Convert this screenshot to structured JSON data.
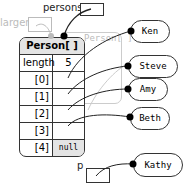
{
  "variables": {
    "persons": "persons",
    "larger": "larger",
    "p": "p"
  },
  "array": {
    "title": "Person[ ]",
    "ghost_title": "Person[ ]",
    "length_label": "length",
    "length_value": "5",
    "indices": [
      "[0]",
      "[1]",
      "[2]",
      "[3]",
      "[4]"
    ],
    "last_value": "null"
  },
  "objects": [
    "Ken",
    "Steve",
    "Amy",
    "Beth",
    "Kathy"
  ]
}
